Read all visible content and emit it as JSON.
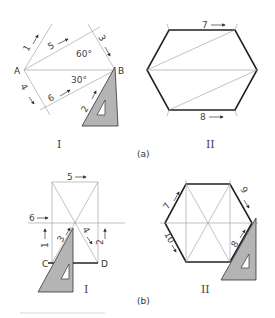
{
  "figure": {
    "part_a": {
      "caption": "(a)",
      "step_I": {
        "label": "I",
        "points": {
          "A": "A",
          "B": "B"
        },
        "angles": [
          "60°",
          "30°"
        ],
        "step_numbers": [
          "1",
          "2",
          "3",
          "4",
          "5",
          "6"
        ]
      },
      "step_II": {
        "label": "II",
        "step_numbers": [
          "7",
          "8"
        ]
      }
    },
    "part_b": {
      "caption": "(b)",
      "step_I": {
        "label": "I",
        "points": {
          "C": "C",
          "D": "D"
        },
        "step_numbers": [
          "1",
          "2",
          "3",
          "4",
          "5",
          "6"
        ]
      },
      "step_II": {
        "label": "II",
        "step_numbers": [
          "7",
          "8",
          "9",
          "10"
        ]
      }
    }
  }
}
